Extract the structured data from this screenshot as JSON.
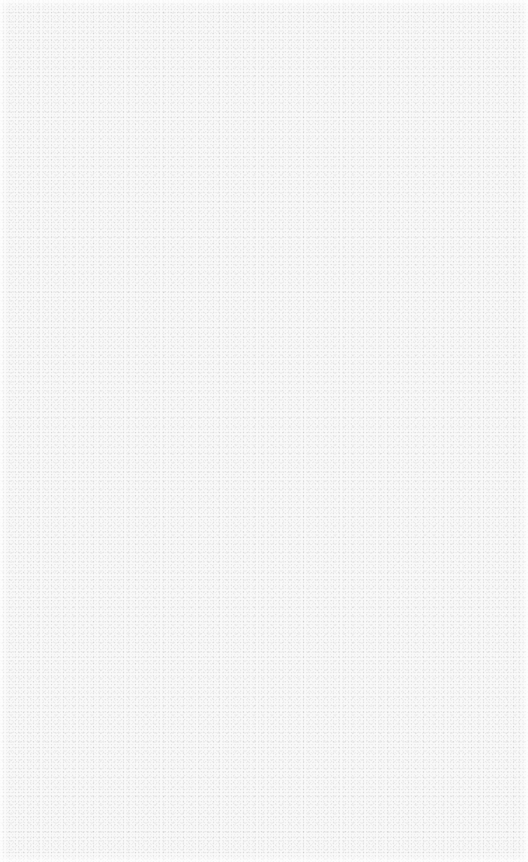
{
  "canvas": {
    "description": "blank textured surface",
    "background_color": "#f9f9f9",
    "texture": "fine grain noise",
    "content": ""
  }
}
